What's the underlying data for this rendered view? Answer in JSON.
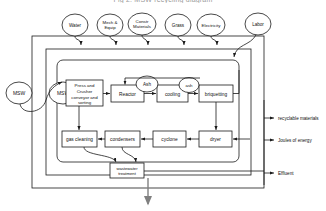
{
  "title": "Fig 2: MSW recycling diagram",
  "colors": {
    "line": "#1a1a1a",
    "text": "#111111",
    "bg": "#ffffff",
    "title": "#9a9a9a"
  },
  "inputs": [
    {
      "id": "water",
      "label": "Water"
    },
    {
      "id": "mech-equip",
      "label_line1": "Mech &",
      "label_line2": "Equip"
    },
    {
      "id": "constr-materials",
      "label_line1": "Constr",
      "label_line2": "Materials"
    },
    {
      "id": "grass",
      "label": "Grass"
    },
    {
      "id": "electricity",
      "label": "Electricity"
    },
    {
      "id": "labor",
      "label": "Labor"
    }
  ],
  "sources": [
    {
      "id": "msw-outer",
      "label": "MSW"
    },
    {
      "id": "msw-inner",
      "label": "MSW"
    }
  ],
  "processes": [
    {
      "id": "press-crusher",
      "label_line1": "Press and",
      "label_line2": "Crusher",
      "label_line3": "conveyor and",
      "label_line4": "sorting"
    },
    {
      "id": "reactor",
      "label": "Reactor"
    },
    {
      "id": "cooling",
      "label": "cooling"
    },
    {
      "id": "briquetting",
      "label": "briquetting"
    },
    {
      "id": "dryer",
      "label": "dryer"
    },
    {
      "id": "cyclone",
      "label": "cyclone"
    },
    {
      "id": "condensers",
      "label": "condensers"
    },
    {
      "id": "gas-cleaning",
      "label": "gas cleaning"
    },
    {
      "id": "wastewater-treatment",
      "label_line1": "wastewater",
      "label_line2": "treatment"
    }
  ],
  "byproducts": [
    {
      "id": "ash-reactor",
      "label": "Ash"
    },
    {
      "id": "ash-cooling",
      "label": "ash"
    }
  ],
  "outputs": [
    {
      "id": "recyclable-materials",
      "label": "recyclable materials"
    },
    {
      "id": "joules-of-energy",
      "label": "Joules of energy"
    },
    {
      "id": "effluent",
      "label": "Effluent"
    }
  ]
}
